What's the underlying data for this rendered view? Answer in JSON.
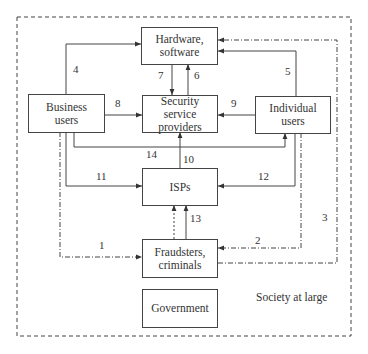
{
  "diagram": {
    "container_label": "Society at large",
    "nodes": {
      "hardware": "Hardware,\nsoftware",
      "security": "Security\nservice\nproviders",
      "business": "Business\nusers",
      "individual": "Individual\nusers",
      "isps": "ISPs",
      "fraudsters": "Fraudsters,\ncriminals",
      "government": "Government"
    },
    "edges": [
      {
        "id": "1",
        "from": "business",
        "to": "fraudsters",
        "style": "dash-dot"
      },
      {
        "id": "2",
        "from": "individual",
        "to": "fraudsters",
        "style": "dash-dot"
      },
      {
        "id": "3",
        "from": "fraudsters",
        "to": "hardware",
        "style": "dash-dot"
      },
      {
        "id": "4",
        "from": "business",
        "to": "hardware",
        "style": "solid"
      },
      {
        "id": "5",
        "from": "individual",
        "to": "hardware",
        "style": "solid"
      },
      {
        "id": "6",
        "from": "security",
        "to": "hardware",
        "style": "solid"
      },
      {
        "id": "7",
        "from": "hardware",
        "to": "security",
        "style": "solid"
      },
      {
        "id": "8",
        "from": "business",
        "to": "security",
        "style": "solid"
      },
      {
        "id": "9",
        "from": "individual",
        "to": "security",
        "style": "solid"
      },
      {
        "id": "10",
        "from": "isps",
        "to": "security",
        "style": "solid"
      },
      {
        "id": "11",
        "from": "business",
        "to": "isps",
        "style": "solid"
      },
      {
        "id": "12",
        "from": "individual",
        "to": "isps",
        "style": "solid"
      },
      {
        "id": "13",
        "from": "fraudsters",
        "to": "isps",
        "style": "solid"
      },
      {
        "id": "14",
        "from": "business",
        "to": "individual",
        "style": "solid"
      }
    ],
    "edge_labels": [
      "1",
      "2",
      "3",
      "4",
      "5",
      "6",
      "7",
      "8",
      "9",
      "10",
      "11",
      "12",
      "13",
      "14"
    ]
  }
}
